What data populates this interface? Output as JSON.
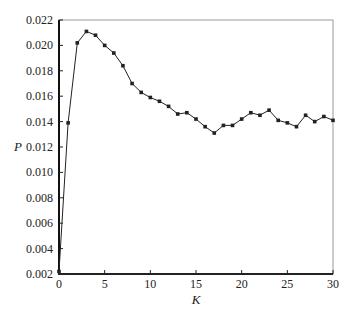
{
  "chart_data": {
    "type": "line",
    "title": "",
    "xlabel": "K",
    "ylabel": "P",
    "xlim": [
      0,
      30
    ],
    "ylim": [
      0.002,
      0.022
    ],
    "xticks": [
      0,
      5,
      10,
      15,
      20,
      25,
      30
    ],
    "xtick_labels": [
      "0",
      "5",
      "10",
      "15",
      "20",
      "25",
      "30"
    ],
    "yticks": [
      0.002,
      0.004,
      0.006,
      0.008,
      0.01,
      0.012,
      0.014,
      0.016,
      0.018,
      0.02,
      0.022
    ],
    "ytick_labels": [
      "0.002",
      "0.004",
      "0.006",
      "0.008",
      "0.010",
      "0.012",
      "0.014",
      "0.016",
      "0.018",
      "0.020",
      "0.022"
    ],
    "grid": false,
    "legend": null,
    "series": [
      {
        "name": "P",
        "marker": "square",
        "color": "#222222",
        "x": [
          0,
          1,
          2,
          3,
          4,
          5,
          6,
          7,
          8,
          9,
          10,
          11,
          12,
          13,
          14,
          15,
          16,
          17,
          18,
          19,
          20,
          21,
          22,
          23,
          24,
          25,
          26,
          27,
          28,
          29,
          30
        ],
        "values": [
          0.0022,
          0.0139,
          0.0202,
          0.0211,
          0.0208,
          0.02,
          0.0194,
          0.0184,
          0.017,
          0.0163,
          0.0159,
          0.0156,
          0.0152,
          0.0146,
          0.0147,
          0.0142,
          0.0136,
          0.0131,
          0.0137,
          0.0137,
          0.0142,
          0.0147,
          0.0145,
          0.0149,
          0.0141,
          0.0139,
          0.0136,
          0.0145,
          0.014,
          0.0144,
          0.0141
        ]
      }
    ]
  }
}
